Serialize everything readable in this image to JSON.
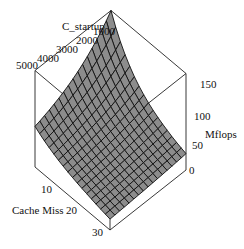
{
  "chart_data": {
    "type": "surface3d",
    "title": "",
    "axes": {
      "x": {
        "label": "C_startup",
        "ticks": [
          "1000",
          "2000",
          "3000",
          "4000",
          "5000"
        ],
        "range": [
          1000,
          5000
        ]
      },
      "y": {
        "label": "Cache Miss",
        "ticks": [
          "10",
          "20",
          "30"
        ],
        "range": [
          0,
          30
        ]
      },
      "z": {
        "label": "Mflops",
        "ticks": [
          "0",
          "50",
          "100",
          "150"
        ],
        "range": [
          0,
          160
        ]
      }
    },
    "surface": {
      "description": "Mflops decreasing from ~160 at C_startup=1000, Cache Miss=0 toward ~40 at high C_startup and high Cache Miss",
      "corners": [
        {
          "C_startup": 1000,
          "cache_miss": 0,
          "mflops": 160
        },
        {
          "C_startup": 5000,
          "cache_miss": 0,
          "mflops": 60
        },
        {
          "C_startup": 1000,
          "cache_miss": 30,
          "mflops": 25
        },
        {
          "C_startup": 5000,
          "cache_miss": 30,
          "mflops": 20
        }
      ],
      "grid": [
        16,
        16
      ],
      "fill_color": "#8c8c8c",
      "line_color": "#111111"
    },
    "grid": false,
    "legend": null
  }
}
